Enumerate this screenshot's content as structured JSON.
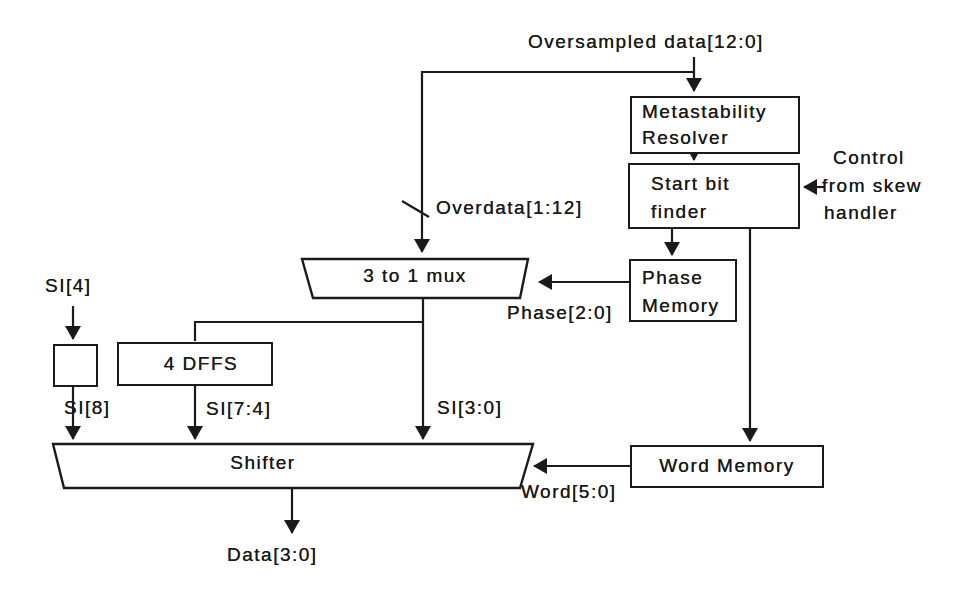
{
  "diagram": {
    "colors": {
      "ink": "#1a1a1a",
      "paper": "#ffffff"
    },
    "labels": {
      "oversampled_data": "Oversampled data[12:0]",
      "overdata_bus": "Overdata[1:12]",
      "phase_bus": "Phase[2:0]",
      "control": [
        "Control",
        "from skew",
        "handler"
      ],
      "si4": "SI[4]",
      "si8": "SI[8]",
      "si74": "SI[7:4]",
      "si30": "SI[3:0]",
      "word_bus": "Word[5:0]",
      "data_out": "Data[3:0]"
    },
    "blocks": {
      "metastability_resolver": {
        "line1": "Metastability",
        "line2": "Resolver"
      },
      "start_bit_finder": {
        "line1": "Start bit",
        "line2": "finder"
      },
      "phase_memory": {
        "line1": "Phase",
        "line2": "Memory"
      },
      "word_memory": {
        "label": "Word Memory"
      },
      "four_dffs": {
        "label": "4 DFFS"
      },
      "mux": {
        "label": "3 to 1 mux"
      },
      "shifter": {
        "label": "Shifter"
      }
    }
  }
}
